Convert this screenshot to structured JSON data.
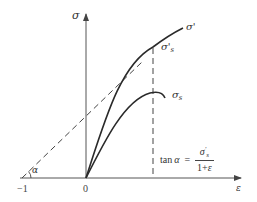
{
  "diagram": {
    "type": "stress-strain curves",
    "axes": {
      "y_label": "σ",
      "x_label": "ε",
      "origin_label": "0",
      "neg_tick_label": "−1"
    },
    "curves": [
      {
        "id": "true-stress",
        "label": "σ'",
        "style": "solid"
      },
      {
        "id": "engineering-stress",
        "label": "σ",
        "label_sub": "s",
        "style": "solid"
      }
    ],
    "points": {
      "true_ultimate": {
        "label": "σ'",
        "label_sub": "s"
      }
    },
    "construction": {
      "tangent_line_style": "dashed",
      "vertical_line_style": "dashed",
      "angle_label": "α"
    },
    "formula": {
      "lhs_func": "tan",
      "lhs_var": "α",
      "equals": "=",
      "numerator": "σ's",
      "numerator_base": "σ",
      "numerator_prime": "'",
      "numerator_sub": "s",
      "denominator_prefix": "1+",
      "denominator_var": "ε"
    },
    "colors": {
      "line": "#2a2a2a",
      "axis": "#555555",
      "dash": "#444444"
    }
  }
}
